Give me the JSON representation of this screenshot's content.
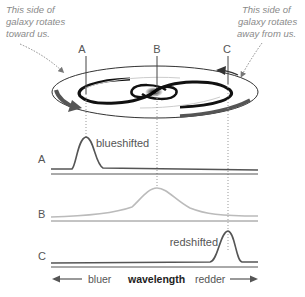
{
  "notes": {
    "left": [
      "This side of",
      "galaxy rotates",
      "toward us."
    ],
    "right": [
      "This side of",
      "galaxy rotates",
      "away from us."
    ]
  },
  "markers": {
    "a": "A",
    "b": "B",
    "c": "C"
  },
  "spectra": {
    "a_label": "A",
    "b_label": "B",
    "c_label": "C",
    "a_annotation": "blueshifted",
    "c_annotation": "redshifted"
  },
  "axis": {
    "left": "bluer",
    "center": "wavelength",
    "right": "redder"
  },
  "colors": {
    "line_dark": "#555555",
    "line_light": "#bbbbbb",
    "arrow": "#555555"
  }
}
